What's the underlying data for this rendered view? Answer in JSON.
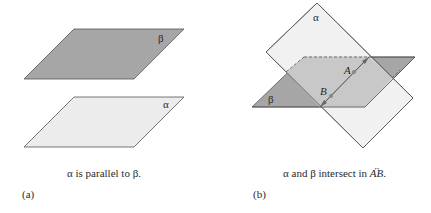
{
  "figure_a": {
    "panel_label": "(a)",
    "caption": "α is parallel to β.",
    "planes": [
      {
        "name": "β",
        "fill": "#a6a6a6",
        "position": "top"
      },
      {
        "name": "α",
        "fill": "#ececec",
        "position": "bottom"
      }
    ],
    "labels": {
      "beta": "β",
      "alpha": "α"
    }
  },
  "figure_b": {
    "panel_label": "(b)",
    "caption_prefix": "α and β intersect in ",
    "caption_line": "AB",
    "caption_suffix": ".",
    "planes": [
      {
        "name": "α",
        "fill": "#ececec"
      },
      {
        "name": "β",
        "fill": "#a6a6a6"
      }
    ],
    "labels": {
      "alpha": "α",
      "beta": "β",
      "point_a": "A",
      "point_b": "B"
    },
    "colors": {
      "dark_plane": "#a6a6a6",
      "light_plane": "#ececec",
      "overlap": "#c8c8c8",
      "line": "#555555"
    }
  }
}
